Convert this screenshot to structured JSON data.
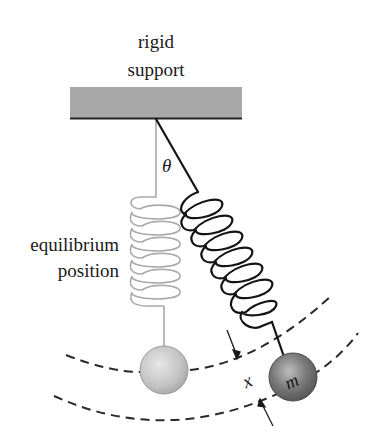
{
  "figure": {
    "title_labels": {
      "support_line1": "rigid",
      "support_line2": "support",
      "equilibrium_line1": "equilibrium",
      "equilibrium_line2": "position",
      "angle_symbol": "θ",
      "displacement_symbol": "x",
      "mass_symbol": "m"
    },
    "elements": {
      "rigid_support": {
        "color": "#a8a8a8",
        "edge_color": "#222222"
      },
      "equilibrium_spring": {
        "color": "#a9a9a9",
        "coils": 6
      },
      "displaced_spring": {
        "color": "#141414",
        "coils": 7
      },
      "equilibrium_mass": {
        "color": "#c4c4c4"
      },
      "displaced_mass": {
        "color": "#6f6f6f"
      },
      "arc_paths": {
        "style": "dashed",
        "color": "#2a2a2a",
        "count": 2
      }
    }
  }
}
